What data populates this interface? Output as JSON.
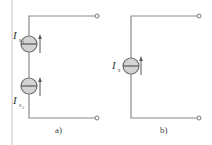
{
  "diagram": {
    "left_border_color": "#c8c8c8",
    "panels": [
      {
        "id": "a",
        "caption": "a)",
        "sources": [
          {
            "label_main": "I",
            "label_sub": "s",
            "label_subsub": "1"
          },
          {
            "label_main": "I",
            "label_sub": "s",
            "label_subsub": "2"
          }
        ]
      },
      {
        "id": "b",
        "caption": "b)",
        "sources": [
          {
            "label_main": "I",
            "label_sub": "s"
          }
        ]
      }
    ]
  }
}
